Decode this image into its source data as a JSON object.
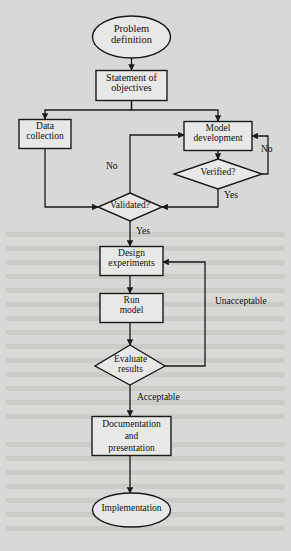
{
  "diagram": {
    "background_color": "#d8d8d6",
    "shape_fill": "#e8e8e6",
    "stroke_color": "#1a1a1a",
    "nodes": [
      {
        "id": "problem",
        "shape": "ellipse",
        "label_line1": "Problem",
        "label_line2": "definition",
        "label_line3": ""
      },
      {
        "id": "statement",
        "shape": "rect",
        "label_line1": "Statement of",
        "label_line2": "objectives",
        "label_line3": ""
      },
      {
        "id": "data",
        "shape": "rect",
        "label_line1": "Data",
        "label_line2": "collection",
        "label_line3": ""
      },
      {
        "id": "model",
        "shape": "rect",
        "label_line1": "Model",
        "label_line2": "development",
        "label_line3": ""
      },
      {
        "id": "verified",
        "shape": "diamond",
        "label_line1": "Verified?",
        "label_line2": "",
        "label_line3": ""
      },
      {
        "id": "validated",
        "shape": "diamond",
        "label_line1": "Validated?",
        "label_line2": "",
        "label_line3": ""
      },
      {
        "id": "design",
        "shape": "rect",
        "label_line1": "Design",
        "label_line2": "experiments",
        "label_line3": ""
      },
      {
        "id": "run",
        "shape": "rect",
        "label_line1": "Run",
        "label_line2": "model",
        "label_line3": ""
      },
      {
        "id": "evaluate",
        "shape": "diamond",
        "label_line1": "Evaluate",
        "label_line2": "results",
        "label_line3": ""
      },
      {
        "id": "documentation",
        "shape": "rect",
        "label_line1": "Documentation",
        "label_line2": "and",
        "label_line3": "presentation"
      },
      {
        "id": "implementation",
        "shape": "ellipse",
        "label_line1": "Implementation",
        "label_line2": "",
        "label_line3": ""
      }
    ],
    "edge_labels": {
      "verified_no": "No",
      "verified_yes": "Yes",
      "validated_no": "No",
      "validated_yes": "Yes",
      "evaluate_unacceptable": "Unacceptable",
      "evaluate_acceptable": "Acceptable"
    }
  }
}
